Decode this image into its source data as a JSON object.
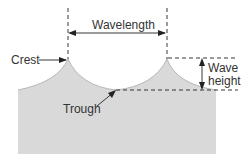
{
  "diagram": {
    "labels": {
      "wavelength": "Wavelength",
      "crest": "Crest",
      "trough": "Trough",
      "wave_height_line1": "Wave",
      "wave_height_line2": "height"
    },
    "colors": {
      "water": "#d9d9d9",
      "water_edge": "#a8a8a8",
      "lines": "#222222",
      "text": "#333333"
    }
  }
}
